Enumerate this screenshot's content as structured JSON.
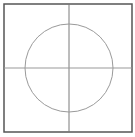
{
  "diagram": {
    "type": "circle-in-square-with-crosshair",
    "frame": {
      "x": 4,
      "y": 4,
      "width": 128,
      "height": 128,
      "stroke": "#555555",
      "stroke_width": 1.5
    },
    "axes": {
      "vertical_x": 69,
      "horizontal_y": 68,
      "stroke": "#888888"
    },
    "circle": {
      "cx": 69,
      "cy": 68,
      "r": 44,
      "stroke": "#999999"
    }
  }
}
